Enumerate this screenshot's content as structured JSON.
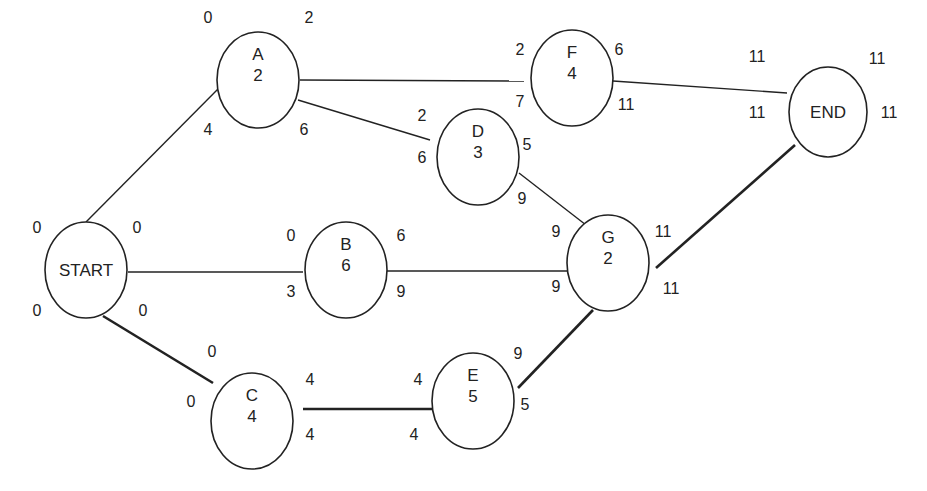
{
  "diagram": {
    "type": "activity-on-node network (critical path)",
    "nodes": [
      {
        "id": "START",
        "label": "START",
        "duration": "",
        "es": "0",
        "ef": "0",
        "ls": "0",
        "lf": "0",
        "cx": 86,
        "cy": 270,
        "rx": 41,
        "ry": 48
      },
      {
        "id": "A",
        "label": "A",
        "duration": "2",
        "es": "0",
        "ef": "2",
        "ls": "4",
        "lf": "6",
        "cx": 258,
        "cy": 80,
        "rx": 41,
        "ry": 48
      },
      {
        "id": "B",
        "label": "B",
        "duration": "6",
        "es": "0",
        "ef": "6",
        "ls": "3",
        "lf": "9",
        "cx": 346,
        "cy": 270,
        "rx": 41,
        "ry": 48
      },
      {
        "id": "C",
        "label": "C",
        "duration": "4",
        "es": "0",
        "ef": "4",
        "ls": "0",
        "lf": "4",
        "cx": 252,
        "cy": 421,
        "rx": 41,
        "ry": 48
      },
      {
        "id": "D",
        "label": "D",
        "duration": "3",
        "es": "2",
        "ef": "5",
        "ls": "6",
        "lf": "9",
        "cx": 478,
        "cy": 157,
        "rx": 41,
        "ry": 48
      },
      {
        "id": "E",
        "label": "E",
        "duration": "5",
        "es": "4",
        "ef": "9",
        "ls": "4",
        "lf": "9",
        "cx": 473,
        "cy": 401,
        "rx": 41,
        "ry": 48
      },
      {
        "id": "F",
        "label": "F",
        "duration": "4",
        "es": "2",
        "ef": "6",
        "ls": "7",
        "lf": "11",
        "cx": 572,
        "cy": 78,
        "rx": 41,
        "ry": 48
      },
      {
        "id": "G",
        "label": "G",
        "duration": "2",
        "es": "9",
        "ef": "11",
        "ls": "9",
        "lf": "11",
        "cx": 608,
        "cy": 263,
        "rx": 41,
        "ry": 48
      },
      {
        "id": "END",
        "label": "END",
        "duration": "",
        "es": "11",
        "ef": "11",
        "ls": "11",
        "lf": "11",
        "cx": 828,
        "cy": 112,
        "rx": 39,
        "ry": 45
      }
    ],
    "edges": [
      {
        "from": "START",
        "to": "A",
        "critical": false,
        "x1": 86,
        "y1": 222,
        "x2": 218,
        "y2": 89
      },
      {
        "from": "START",
        "to": "B",
        "critical": false,
        "x1": 128,
        "y1": 272,
        "x2": 303,
        "y2": 272
      },
      {
        "from": "START",
        "to": "C",
        "critical": true,
        "x1": 103,
        "y1": 316,
        "x2": 213,
        "y2": 383
      },
      {
        "from": "A",
        "to": "F",
        "critical": false,
        "x1": 300,
        "y1": 80,
        "x2": 524,
        "y2": 81
      },
      {
        "from": "A",
        "to": "D",
        "critical": false,
        "x1": 298,
        "y1": 100,
        "x2": 430,
        "y2": 140
      },
      {
        "from": "D",
        "to": "G",
        "critical": false,
        "x1": 519,
        "y1": 173,
        "x2": 586,
        "y2": 225
      },
      {
        "from": "B",
        "to": "G",
        "critical": false,
        "x1": 387,
        "y1": 271,
        "x2": 567,
        "y2": 271
      },
      {
        "from": "C",
        "to": "E",
        "critical": true,
        "x1": 303,
        "y1": 409,
        "x2": 432,
        "y2": 409
      },
      {
        "from": "E",
        "to": "G",
        "critical": true,
        "x1": 518,
        "y1": 388,
        "x2": 593,
        "y2": 310
      },
      {
        "from": "F",
        "to": "END",
        "critical": false,
        "x1": 613,
        "y1": 81,
        "x2": 787,
        "y2": 93
      },
      {
        "from": "G",
        "to": "END",
        "critical": true,
        "x1": 656,
        "y1": 268,
        "x2": 795,
        "y2": 145
      }
    ],
    "labels": [
      {
        "node": "START",
        "field": "es",
        "text": "0",
        "x": 37,
        "y": 233
      },
      {
        "node": "START",
        "field": "ef",
        "text": "0",
        "x": 137,
        "y": 233
      },
      {
        "node": "START",
        "field": "ls",
        "text": "0",
        "x": 37,
        "y": 316
      },
      {
        "node": "START",
        "field": "lf",
        "text": "0",
        "x": 143,
        "y": 316
      },
      {
        "node": "A",
        "field": "es",
        "text": "0",
        "x": 208,
        "y": 23
      },
      {
        "node": "A",
        "field": "ef",
        "text": "2",
        "x": 309,
        "y": 23
      },
      {
        "node": "A",
        "field": "ls",
        "text": "4",
        "x": 208,
        "y": 135
      },
      {
        "node": "A",
        "field": "lf",
        "text": "6",
        "x": 304,
        "y": 135
      },
      {
        "node": "B",
        "field": "es",
        "text": "0",
        "x": 291,
        "y": 241
      },
      {
        "node": "B",
        "field": "ef",
        "text": "6",
        "x": 401,
        "y": 241
      },
      {
        "node": "B",
        "field": "ls",
        "text": "3",
        "x": 291,
        "y": 297
      },
      {
        "node": "B",
        "field": "lf",
        "text": "9",
        "x": 401,
        "y": 297
      },
      {
        "node": "C",
        "field": "es",
        "text": "0",
        "x": 212,
        "y": 357
      },
      {
        "node": "C",
        "field": "ef",
        "text": "4",
        "x": 310,
        "y": 385
      },
      {
        "node": "C",
        "field": "ls",
        "text": "0",
        "x": 191,
        "y": 407
      },
      {
        "node": "C",
        "field": "lf",
        "text": "4",
        "x": 310,
        "y": 440
      },
      {
        "node": "D",
        "field": "es",
        "text": "2",
        "x": 422,
        "y": 121
      },
      {
        "node": "D",
        "field": "ef",
        "text": "5",
        "x": 527,
        "y": 150
      },
      {
        "node": "D",
        "field": "ls",
        "text": "6",
        "x": 422,
        "y": 163
      },
      {
        "node": "D",
        "field": "lf",
        "text": "9",
        "x": 522,
        "y": 204
      },
      {
        "node": "E",
        "field": "es",
        "text": "4",
        "x": 418,
        "y": 385
      },
      {
        "node": "E",
        "field": "ef",
        "text": "9",
        "x": 518,
        "y": 359
      },
      {
        "node": "E",
        "field": "ls",
        "text": "4",
        "x": 414,
        "y": 440
      },
      {
        "node": "E",
        "field": "lf",
        "text": "5",
        "x": 525,
        "y": 410
      },
      {
        "node": "F",
        "field": "es",
        "text": "2",
        "x": 520,
        "y": 55
      },
      {
        "node": "F",
        "field": "ef",
        "text": "6",
        "x": 619,
        "y": 55
      },
      {
        "node": "F",
        "field": "ls",
        "text": "7",
        "x": 520,
        "y": 107
      },
      {
        "node": "F",
        "field": "lf",
        "text": "11",
        "x": 626,
        "y": 110
      },
      {
        "node": "G",
        "field": "es",
        "text": "9",
        "x": 556,
        "y": 237
      },
      {
        "node": "G",
        "field": "ef",
        "text": "11",
        "x": 663,
        "y": 237
      },
      {
        "node": "G",
        "field": "ls",
        "text": "9",
        "x": 556,
        "y": 292
      },
      {
        "node": "G",
        "field": "lf",
        "text": "11",
        "x": 671,
        "y": 294
      },
      {
        "node": "END",
        "field": "es",
        "text": "11",
        "x": 757,
        "y": 62
      },
      {
        "node": "END",
        "field": "ef",
        "text": "11",
        "x": 877,
        "y": 64
      },
      {
        "node": "END",
        "field": "ls",
        "text": "11",
        "x": 757,
        "y": 118
      },
      {
        "node": "END",
        "field": "lf",
        "text": "11",
        "x": 889,
        "y": 118
      }
    ],
    "critical_path": [
      "START",
      "C",
      "E",
      "G",
      "END"
    ],
    "project_duration": "11",
    "colors": {
      "line": "#222222",
      "background": "#ffffff"
    }
  }
}
